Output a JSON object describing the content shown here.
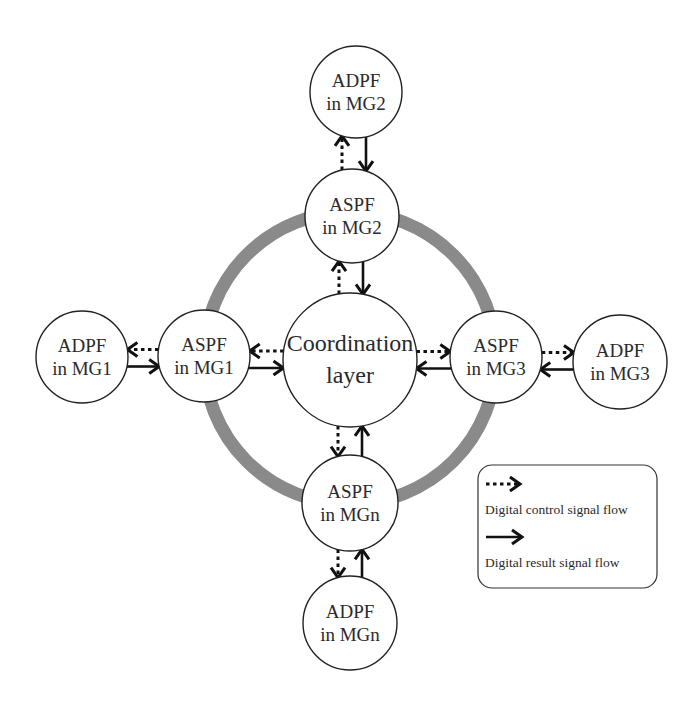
{
  "diagram": {
    "ring": {
      "color": "#8a8a8a"
    },
    "core": {
      "id": "core",
      "lines": [
        "Coordination",
        "layer"
      ]
    },
    "nodes": [
      {
        "id": "adpf2",
        "lines": [
          "ADPF",
          "in MG2"
        ]
      },
      {
        "id": "aspf2",
        "lines": [
          "ASPF",
          "in MG2"
        ]
      },
      {
        "id": "adpf1",
        "lines": [
          "ADPF",
          "in MG1"
        ]
      },
      {
        "id": "aspf1",
        "lines": [
          "ASPF",
          "in MG1"
        ]
      },
      {
        "id": "aspf3",
        "lines": [
          "ASPF",
          "in MG3"
        ]
      },
      {
        "id": "adpf3",
        "lines": [
          "ADPF",
          "in MG3"
        ]
      },
      {
        "id": "aspfn",
        "lines": [
          "ASPF",
          "in MGn"
        ]
      },
      {
        "id": "adpfn",
        "lines": [
          "ADPF",
          "in MGn"
        ]
      }
    ],
    "edges": [
      {
        "from": "aspf2",
        "to": "adpf2",
        "type": "control"
      },
      {
        "from": "adpf2",
        "to": "aspf2",
        "type": "result"
      },
      {
        "from": "core",
        "to": "aspf2",
        "type": "control"
      },
      {
        "from": "aspf2",
        "to": "core",
        "type": "result"
      },
      {
        "from": "aspf1",
        "to": "adpf1",
        "type": "control"
      },
      {
        "from": "adpf1",
        "to": "aspf1",
        "type": "result"
      },
      {
        "from": "core",
        "to": "aspf1",
        "type": "control"
      },
      {
        "from": "aspf1",
        "to": "core",
        "type": "result"
      },
      {
        "from": "core",
        "to": "aspf3",
        "type": "control"
      },
      {
        "from": "aspf3",
        "to": "core",
        "type": "result"
      },
      {
        "from": "aspf3",
        "to": "adpf3",
        "type": "control"
      },
      {
        "from": "adpf3",
        "to": "aspf3",
        "type": "result"
      },
      {
        "from": "core",
        "to": "aspfn",
        "type": "control"
      },
      {
        "from": "aspfn",
        "to": "core",
        "type": "result"
      },
      {
        "from": "aspfn",
        "to": "adpfn",
        "type": "control"
      },
      {
        "from": "adpfn",
        "to": "aspfn",
        "type": "result"
      }
    ]
  },
  "legend": {
    "control_label": "Digital control signal flow",
    "result_label": "Digital result signal flow"
  }
}
